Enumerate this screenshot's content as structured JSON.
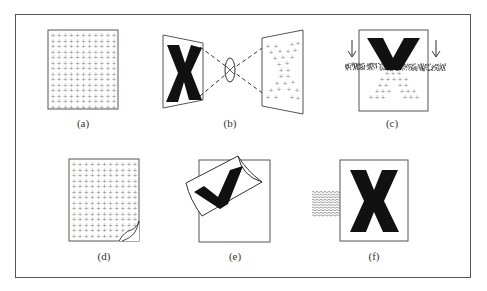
{
  "figure": {
    "panels": [
      {
        "id": "a",
        "caption": "(a)",
        "description": "regular grid of plus marks on a flat sheet"
      },
      {
        "id": "b",
        "caption": "(b)",
        "description": "letter X projected through a lens onto a tilted plane as scattered plus marks"
      },
      {
        "id": "c",
        "caption": "(c)",
        "description": "V shape descending into a noisy band with arrows, plus marks below"
      },
      {
        "id": "d",
        "caption": "(d)",
        "description": "grid of plus marks on a sheet with curled bottom-right corner"
      },
      {
        "id": "e",
        "caption": "(e)",
        "description": "curled sheet bearing a check mark over a square frame"
      },
      {
        "id": "f",
        "caption": "(f)",
        "description": "letter X in a frame with wavy lines entering from the left"
      }
    ],
    "glyphs": {
      "b_letter": "X",
      "c_letter": "V",
      "e_mark": "✓",
      "f_letter": "X"
    },
    "colors": {
      "ink": "#111111",
      "line": "#555555",
      "dots": "#8a8a8a",
      "background": "#ffffff"
    }
  }
}
